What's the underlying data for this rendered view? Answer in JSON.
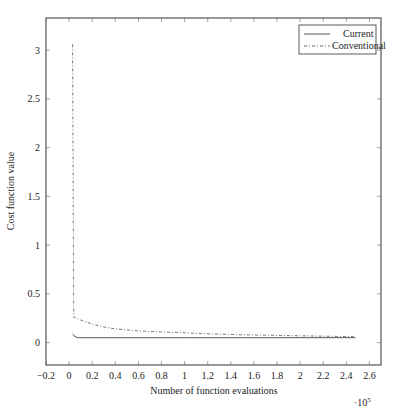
{
  "chart_data": {
    "type": "line",
    "title": "",
    "xlabel": "Number of function evaluations",
    "ylabel": "Cost function value",
    "x_multiplier": "·10^5",
    "xlim": [
      -0.2,
      2.7
    ],
    "ylim": [
      -0.23,
      3.33
    ],
    "xticks": [
      -0.2,
      0,
      0.2,
      0.4,
      0.6,
      0.8,
      1,
      1.2,
      1.4,
      1.6,
      1.8,
      2,
      2.2,
      2.4,
      2.6
    ],
    "yticks": [
      0,
      0.5,
      1,
      1.5,
      2,
      2.5,
      3
    ],
    "grid": false,
    "legend_position": "upper right",
    "series": [
      {
        "name": "Current",
        "style": "solid",
        "x": [
          0.03,
          0.05,
          0.08,
          0.2,
          0.5,
          1.0,
          1.5,
          2.0,
          2.48
        ],
        "y": [
          0.09,
          0.06,
          0.05,
          0.05,
          0.05,
          0.05,
          0.05,
          0.05,
          0.05
        ]
      },
      {
        "name": "Conventional",
        "style": "dash-dot",
        "x": [
          0.03,
          0.04,
          0.08,
          0.15,
          0.2,
          0.3,
          0.4,
          0.6,
          0.8,
          1.0,
          1.2,
          1.5,
          2.0,
          2.48
        ],
        "y": [
          3.06,
          0.26,
          0.24,
          0.21,
          0.19,
          0.16,
          0.14,
          0.12,
          0.11,
          0.1,
          0.09,
          0.08,
          0.07,
          0.06
        ]
      }
    ]
  },
  "legend": {
    "current": "Current",
    "conventional": "Conventional"
  },
  "axes": {
    "xlabel": "Number of function evaluations",
    "ylabel": "Cost function value",
    "multiplier_base": "·10",
    "multiplier_exp": "5"
  }
}
